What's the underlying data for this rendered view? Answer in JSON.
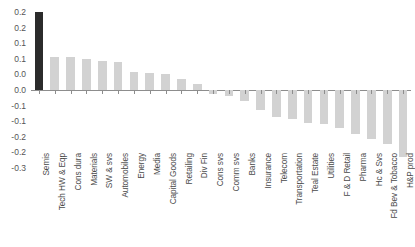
{
  "chart_data": {
    "type": "bar",
    "title": "",
    "subtitle": "",
    "xlabel": "",
    "ylabel": "",
    "ylim": [
      -0.25,
      0.25
    ],
    "ytick_values": [
      0.25,
      0.2,
      0.15,
      0.1,
      0.05,
      0.0,
      -0.05,
      -0.1,
      -0.15,
      -0.2,
      -0.25
    ],
    "ytick_labels": [
      "0.2",
      "0.2",
      "0.1",
      "0.1",
      "0.0",
      "0.0",
      "-0.1",
      "-0.1",
      "-0.2",
      "-0.2",
      "-0.3"
    ],
    "grid": false,
    "legend": false,
    "legend_position": "none",
    "orientation": "vertical",
    "highlight_index": 0,
    "colors": {
      "bar_default": "#d2d2d2",
      "bar_highlight": "#2b2b2b",
      "axis": "#8d8d8d",
      "tick_text": "#555555",
      "category_text": "#4a4a4a",
      "background": "#ffffff"
    },
    "categories": [
      "Semis",
      "Tech HW & Eqp",
      "Cons dura",
      "Materials",
      "SW & svs",
      "Automobiles",
      "Energy",
      "Media",
      "Capital Goods",
      "Retailing",
      "Div Fin",
      "Cons svs",
      "Comm svs",
      "Banks",
      "Insurance",
      "Telecom",
      "Transportation",
      "Teal Estate",
      "Utilities",
      "F & D Retail",
      "Pharma",
      "Hc & Svs",
      "Fd Bev & Tobacco",
      "H&P prod"
    ],
    "values": [
      0.25,
      0.105,
      0.105,
      0.1,
      0.092,
      0.09,
      0.058,
      0.054,
      0.05,
      0.036,
      0.018,
      -0.014,
      -0.019,
      -0.035,
      -0.065,
      -0.088,
      -0.092,
      -0.105,
      -0.108,
      -0.122,
      -0.14,
      -0.158,
      -0.172,
      -0.215
    ]
  }
}
